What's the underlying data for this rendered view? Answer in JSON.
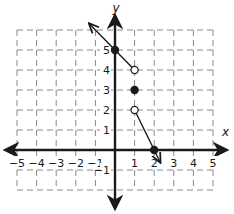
{
  "chart_data": {
    "type": "line",
    "title": "",
    "xlabel": "x",
    "ylabel": "y",
    "xlim": [
      -5,
      5
    ],
    "ylim": [
      -2,
      6
    ],
    "grid": true,
    "x_ticks": [
      -5,
      -4,
      -3,
      -2,
      -1,
      1,
      2,
      3,
      4,
      5
    ],
    "y_ticks": [
      -1,
      1,
      2,
      3,
      4,
      5
    ],
    "x_tick_labels": [
      "−5",
      "−4",
      "−3",
      "−2",
      "−1",
      "1",
      "2",
      "3",
      "4",
      "5"
    ],
    "y_tick_labels": [
      "−1",
      "1",
      "2",
      "3",
      "4",
      "5"
    ],
    "series": [
      {
        "name": "left-piece",
        "segment": [
          [
            -1.3,
            6.3
          ],
          [
            1,
            4
          ]
        ],
        "arrow_at_start": true,
        "arrow_at_end": false
      },
      {
        "name": "right-piece",
        "segment": [
          [
            1,
            2
          ],
          [
            2.3,
            -0.6
          ]
        ],
        "arrow_at_start": false,
        "arrow_at_end": true
      }
    ],
    "points": [
      {
        "x": 0,
        "y": 5,
        "filled": true
      },
      {
        "x": 1,
        "y": 4,
        "filled": false
      },
      {
        "x": 1,
        "y": 3,
        "filled": true
      },
      {
        "x": 1,
        "y": 2,
        "filled": false
      },
      {
        "x": 2,
        "y": 0,
        "filled": true
      }
    ]
  }
}
